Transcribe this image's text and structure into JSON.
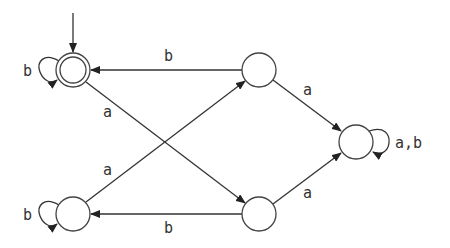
{
  "diagram": {
    "type": "finite-automaton",
    "states": [
      {
        "id": "q0",
        "cx": 73,
        "cy": 70,
        "accepting": true,
        "initial": true
      },
      {
        "id": "q1",
        "cx": 259,
        "cy": 70,
        "accepting": false,
        "initial": false
      },
      {
        "id": "q2",
        "cx": 73,
        "cy": 214,
        "accepting": false,
        "initial": false
      },
      {
        "id": "q3",
        "cx": 259,
        "cy": 214,
        "accepting": false,
        "initial": false
      },
      {
        "id": "q4",
        "cx": 356,
        "cy": 142,
        "accepting": false,
        "initial": false
      }
    ],
    "transitions": [
      {
        "from": "q0",
        "to": "q0",
        "label": "b"
      },
      {
        "from": "q0",
        "to": "q3",
        "label": "a"
      },
      {
        "from": "q1",
        "to": "q0",
        "label": "b"
      },
      {
        "from": "q1",
        "to": "q4",
        "label": "a"
      },
      {
        "from": "q2",
        "to": "q2",
        "label": "b"
      },
      {
        "from": "q2",
        "to": "q1",
        "label": "a"
      },
      {
        "from": "q3",
        "to": "q2",
        "label": "b"
      },
      {
        "from": "q3",
        "to": "q4",
        "label": "a"
      },
      {
        "from": "q4",
        "to": "q4",
        "label": "a,b"
      }
    ],
    "labels": {
      "q0_loop": "b",
      "q0_to_q3": "a",
      "q1_to_q0": "b",
      "q1_to_q4": "a",
      "q2_loop": "b",
      "q2_to_q1": "a",
      "q3_to_q2": "b",
      "q3_to_q4": "a",
      "q4_loop": "a,b"
    }
  }
}
